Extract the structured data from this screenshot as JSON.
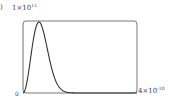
{
  "part_label": ")",
  "chart_data": {
    "type": "line",
    "title": "",
    "xlabel": "",
    "ylabel": "",
    "y_top_label": {
      "mantissa": "1",
      "times": "×",
      "base": "10",
      "exp": "11"
    },
    "x_right_label": {
      "mantissa": "4",
      "times": "×",
      "base": "10",
      "exp": "-10"
    },
    "origin_label": "0",
    "xlim": [
      0,
      4e-10
    ],
    "ylim": [
      0,
      100000000000.0
    ],
    "grid": false,
    "series": [
      {
        "name": "distribution",
        "x": [
          0,
          2e-11,
          4e-11,
          5.6e-11,
          8e-11,
          1.2e-10,
          1.6e-10,
          2e-10,
          2.4e-10,
          2.8e-10,
          3.2e-10,
          3.6e-10,
          4e-10
        ],
        "values": [
          0,
          65000000000.0,
          98000000000.0,
          100000000000.0,
          86000000000.0,
          50000000000.0,
          24000000000.0,
          10000000000.0,
          3500000000.0,
          1000000000.0,
          300000000.0,
          100000000.0,
          0
        ]
      }
    ]
  }
}
